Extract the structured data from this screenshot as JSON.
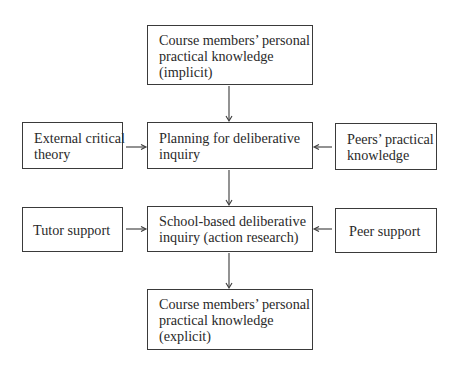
{
  "diagram": {
    "nodes": [
      {
        "id": "ppk_implicit",
        "lines": [
          "Course members’ personal",
          "practical knowledge",
          "(implicit)"
        ]
      },
      {
        "id": "planning",
        "lines": [
          "Planning for deliberative",
          "inquiry"
        ]
      },
      {
        "id": "external_theory",
        "lines": [
          "External critical",
          "theory"
        ]
      },
      {
        "id": "peers_knowledge",
        "lines": [
          "Peers’ practical",
          "knowledge"
        ]
      },
      {
        "id": "school_inquiry",
        "lines": [
          "School-based deliberative",
          "inquiry (action research)"
        ]
      },
      {
        "id": "tutor_support",
        "lines": [
          "Tutor support"
        ]
      },
      {
        "id": "peer_support",
        "lines": [
          "Peer support"
        ]
      },
      {
        "id": "ppk_explicit",
        "lines": [
          "Course members’ personal",
          "practical knowledge",
          "(explicit)"
        ]
      }
    ],
    "edges": [
      {
        "from": "ppk_implicit",
        "to": "planning"
      },
      {
        "from": "external_theory",
        "to": "planning"
      },
      {
        "from": "peers_knowledge",
        "to": "planning"
      },
      {
        "from": "planning",
        "to": "school_inquiry"
      },
      {
        "from": "tutor_support",
        "to": "school_inquiry"
      },
      {
        "from": "peer_support",
        "to": "school_inquiry"
      },
      {
        "from": "school_inquiry",
        "to": "ppk_explicit"
      }
    ]
  }
}
